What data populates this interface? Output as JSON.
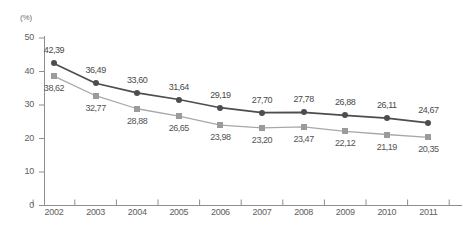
{
  "chart_data": {
    "type": "line",
    "title": "",
    "xlabel": "",
    "ylabel": "",
    "unit_label": "(%)",
    "categories": [
      "2002",
      "2003",
      "2004",
      "2005",
      "2006",
      "2007",
      "2008",
      "2009",
      "2010",
      "2011"
    ],
    "ylim": [
      0,
      50
    ],
    "yticks": [
      0,
      10,
      20,
      30,
      40,
      50
    ],
    "ytick_labels": [
      "0",
      "10",
      "20",
      "30",
      "40",
      "50"
    ],
    "grid": false,
    "legend": "none",
    "decimal_separator": ",",
    "series": [
      {
        "name": "series-dark",
        "marker": "circle",
        "color": "#4d4d4d",
        "line_color": "#4d4d4d",
        "label_position": "above",
        "values": [
          42.39,
          36.49,
          33.6,
          31.64,
          29.19,
          27.7,
          27.78,
          26.88,
          26.11,
          24.67
        ],
        "labels": [
          "42,39",
          "36,49",
          "33,60",
          "31,64",
          "29,19",
          "27,70",
          "27,78",
          "26,88",
          "26,11",
          "24,67"
        ]
      },
      {
        "name": "series-light",
        "marker": "square",
        "color": "#9b9b9b",
        "line_color": "#a8a8a8",
        "label_position": "below",
        "values": [
          38.62,
          32.77,
          28.88,
          26.65,
          23.98,
          23.2,
          23.47,
          22.12,
          21.19,
          20.35
        ],
        "labels": [
          "38,62",
          "32,77",
          "28,88",
          "26,65",
          "23,98",
          "23,20",
          "23,47",
          "22,12",
          "21,19",
          "20,35"
        ]
      }
    ]
  },
  "axis": {
    "unit": "(%)",
    "y_labels": [
      "50",
      "40",
      "30",
      "20",
      "10",
      "0"
    ],
    "x_labels": [
      "2002",
      "2003",
      "2004",
      "2005",
      "2006",
      "2007",
      "2008",
      "2009",
      "2010",
      "2011"
    ]
  },
  "colors": {
    "dark_series": "#4d4d4d",
    "light_series": "#9b9b9b",
    "axis": "#8d8d8d",
    "text": "#5e5e5e",
    "background": "#ffffff"
  }
}
